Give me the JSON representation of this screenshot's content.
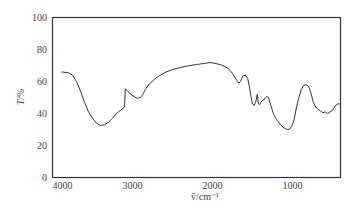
{
  "chart_data": {
    "type": "line",
    "title": "",
    "xlabel": "ṽ/cm⁻¹",
    "ylabel": "T/%",
    "xlim": [
      4000,
      400
    ],
    "ylim": [
      0,
      100
    ],
    "x_reversed": true,
    "grid": false,
    "legend": null,
    "x_ticks": [
      4000,
      3000,
      2000,
      1000
    ],
    "x_tick_labels": [
      "4000",
      "3000",
      "2000",
      "1000"
    ],
    "y_ticks": [
      0,
      20,
      40,
      60,
      80,
      100
    ],
    "y_tick_labels": [
      "0",
      "20",
      "40",
      "60",
      "80",
      "100"
    ],
    "series": [
      {
        "name": "IR spectrum",
        "color": "#333333",
        "x": [
          3890,
          3800,
          3750,
          3700,
          3650,
          3600,
          3550,
          3500,
          3450,
          3400,
          3350,
          3300,
          3250,
          3200,
          3150,
          3100,
          3090,
          3060,
          3020,
          2980,
          2940,
          2900,
          2870,
          2840,
          2800,
          2700,
          2600,
          2500,
          2400,
          2300,
          2200,
          2100,
          2040,
          1980,
          1900,
          1850,
          1800,
          1750,
          1700,
          1670,
          1650,
          1620,
          1590,
          1560,
          1540,
          1520,
          1500,
          1480,
          1460,
          1440,
          1425,
          1410,
          1395,
          1380,
          1360,
          1340,
          1320,
          1300,
          1270,
          1240,
          1210,
          1180,
          1150,
          1120,
          1090,
          1060,
          1040,
          1010,
          980,
          950,
          920,
          890,
          860,
          830,
          800,
          770,
          740,
          710,
          680,
          650,
          620,
          590,
          560,
          530,
          500,
          470,
          440,
          410,
          400
        ],
        "y": [
          66,
          65.5,
          64,
          60,
          54,
          47,
          41,
          37,
          34,
          32.5,
          33,
          34.5,
          37,
          40,
          42,
          44,
          55.5,
          54,
          52,
          50.5,
          49.5,
          50,
          52,
          55,
          58,
          62.5,
          65.5,
          67.5,
          68.8,
          69.8,
          70.6,
          71.3,
          71.8,
          71.5,
          70.5,
          69.5,
          68,
          65,
          61,
          59,
          60,
          63.5,
          64,
          62,
          57,
          51,
          46,
          45,
          47,
          52,
          46,
          45.5,
          47,
          48,
          48.5,
          50,
          50.5,
          50,
          45,
          40,
          37,
          35,
          33,
          31.5,
          30.5,
          30,
          30.2,
          32,
          36,
          44,
          50,
          55,
          57.5,
          58,
          57,
          53,
          47,
          44,
          42.5,
          41.5,
          40.5,
          41,
          40,
          41,
          42,
          44.5,
          46,
          46,
          46
        ]
      }
    ]
  }
}
